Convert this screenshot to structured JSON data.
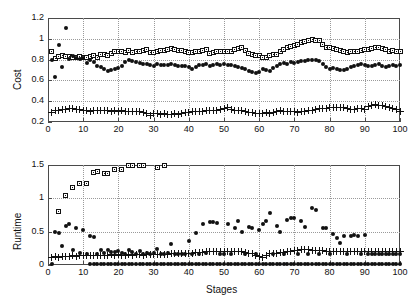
{
  "figure": {
    "background": "#ffffff",
    "axis_color": "#4a4a4a",
    "grid_color": "#9a9a9a",
    "marker_color": "#111111"
  },
  "chart_data": [
    {
      "type": "scatter",
      "id": "cost-panel",
      "title": "",
      "xlabel": "",
      "ylabel": "Cost",
      "xlim": [
        0,
        100
      ],
      "ylim": [
        0.2,
        1.2
      ],
      "xticks": [
        0,
        10,
        20,
        30,
        40,
        50,
        60,
        70,
        80,
        90,
        100
      ],
      "yticks": [
        0.2,
        0.4,
        0.6,
        0.8,
        1.0,
        1.2
      ],
      "xticklabels": [
        "0",
        "10",
        "20",
        "30",
        "40",
        "50",
        "60",
        "70",
        "80",
        "90",
        "100"
      ],
      "yticklabels": [
        "0.2",
        "0.4",
        "0.6",
        "0.8",
        "1",
        "1.2"
      ],
      "grid": true,
      "legend": "none",
      "x": [
        1,
        2,
        3,
        4,
        5,
        6,
        7,
        8,
        9,
        10,
        11,
        12,
        13,
        14,
        15,
        16,
        17,
        18,
        19,
        20,
        21,
        22,
        23,
        24,
        25,
        26,
        27,
        28,
        29,
        30,
        31,
        32,
        33,
        34,
        35,
        36,
        37,
        38,
        39,
        40,
        41,
        42,
        43,
        44,
        45,
        46,
        47,
        48,
        49,
        50,
        51,
        52,
        53,
        54,
        55,
        56,
        57,
        58,
        59,
        60,
        61,
        62,
        63,
        64,
        65,
        66,
        67,
        68,
        69,
        70,
        71,
        72,
        73,
        74,
        75,
        76,
        77,
        78,
        79,
        80,
        81,
        82,
        83,
        84,
        85,
        86,
        87,
        88,
        89,
        90,
        91,
        92,
        93,
        94,
        95,
        96,
        97,
        98,
        99,
        100
      ],
      "series": [
        {
          "name": "marker-square",
          "marker": "square",
          "values": [
            0.88,
            0.81,
            0.83,
            0.84,
            0.83,
            0.83,
            0.82,
            0.82,
            0.83,
            0.82,
            0.82,
            0.83,
            0.84,
            0.82,
            0.85,
            0.85,
            0.84,
            0.86,
            0.88,
            0.88,
            0.88,
            0.87,
            0.89,
            0.87,
            0.88,
            0.88,
            0.89,
            0.9,
            0.87,
            0.87,
            0.88,
            0.89,
            0.89,
            0.9,
            0.91,
            0.9,
            0.89,
            0.89,
            0.88,
            0.87,
            0.87,
            0.88,
            0.88,
            0.89,
            0.9,
            0.86,
            0.87,
            0.88,
            0.88,
            0.88,
            0.88,
            0.88,
            0.9,
            0.91,
            0.92,
            0.89,
            0.86,
            0.85,
            0.84,
            0.84,
            0.82,
            0.82,
            0.84,
            0.85,
            0.85,
            0.88,
            0.9,
            0.92,
            0.93,
            0.94,
            0.95,
            0.96,
            0.97,
            0.98,
            0.99,
            0.98,
            0.98,
            0.95,
            0.92,
            0.92,
            0.91,
            0.9,
            0.89,
            0.88,
            0.87,
            0.88,
            0.88,
            0.88,
            0.89,
            0.9,
            0.9,
            0.91,
            0.92,
            0.92,
            0.91,
            0.9,
            0.88,
            0.89,
            0.88,
            0.88
          ]
        },
        {
          "name": "marker-dot",
          "marker": "dot",
          "values": [
            0.8,
            0.63,
            0.94,
            0.73,
            1.1,
            0.81,
            0.83,
            0.82,
            0.81,
            0.82,
            0.77,
            0.8,
            0.78,
            0.74,
            0.73,
            0.71,
            0.69,
            0.7,
            0.71,
            0.72,
            0.74,
            0.78,
            0.8,
            0.79,
            0.78,
            0.77,
            0.76,
            0.76,
            0.75,
            0.74,
            0.76,
            0.75,
            0.75,
            0.75,
            0.76,
            0.75,
            0.74,
            0.74,
            0.74,
            0.73,
            0.71,
            0.73,
            0.75,
            0.75,
            0.76,
            0.74,
            0.75,
            0.76,
            0.75,
            0.76,
            0.75,
            0.75,
            0.74,
            0.73,
            0.72,
            0.71,
            0.69,
            0.68,
            0.67,
            0.68,
            0.71,
            0.7,
            0.69,
            0.72,
            0.74,
            0.76,
            0.77,
            0.76,
            0.78,
            0.77,
            0.78,
            0.79,
            0.79,
            0.8,
            0.8,
            0.8,
            0.79,
            0.76,
            0.73,
            0.71,
            0.72,
            0.71,
            0.7,
            0.7,
            0.71,
            0.73,
            0.74,
            0.75,
            0.76,
            0.75,
            0.74,
            0.74,
            0.75,
            0.76,
            0.74,
            0.73,
            0.74,
            0.75,
            0.74,
            0.75
          ]
        },
        {
          "name": "marker-plus",
          "marker": "plus",
          "values": [
            0.29,
            0.31,
            0.31,
            0.32,
            0.32,
            0.33,
            0.33,
            0.32,
            0.32,
            0.31,
            0.31,
            0.3,
            0.31,
            0.31,
            0.31,
            0.31,
            0.31,
            0.3,
            0.31,
            0.3,
            0.31,
            0.3,
            0.3,
            0.3,
            0.3,
            0.3,
            0.29,
            0.28,
            0.26,
            0.28,
            0.28,
            0.27,
            0.28,
            0.27,
            0.27,
            0.28,
            0.27,
            0.28,
            0.29,
            0.29,
            0.3,
            0.3,
            0.3,
            0.3,
            0.31,
            0.31,
            0.31,
            0.31,
            0.32,
            0.33,
            0.34,
            0.32,
            0.31,
            0.31,
            0.31,
            0.3,
            0.29,
            0.29,
            0.28,
            0.28,
            0.28,
            0.29,
            0.28,
            0.29,
            0.3,
            0.31,
            0.3,
            0.3,
            0.3,
            0.3,
            0.29,
            0.3,
            0.3,
            0.31,
            0.31,
            0.32,
            0.33,
            0.33,
            0.33,
            0.34,
            0.34,
            0.34,
            0.34,
            0.34,
            0.33,
            0.32,
            0.32,
            0.33,
            0.33,
            0.32,
            0.35,
            0.36,
            0.37,
            0.36,
            0.36,
            0.35,
            0.34,
            0.33,
            0.32,
            0.3
          ]
        }
      ]
    },
    {
      "type": "scatter",
      "id": "runtime-panel",
      "title": "",
      "xlabel": "Stages",
      "ylabel": "Runtime",
      "xlim": [
        0,
        100
      ],
      "ylim": [
        0,
        1.5
      ],
      "xticks": [
        0,
        10,
        20,
        30,
        40,
        50,
        60,
        70,
        80,
        90,
        100
      ],
      "yticks": [
        0,
        0.5,
        1.0,
        1.5
      ],
      "xticklabels": [
        "0",
        "10",
        "20",
        "30",
        "40",
        "50",
        "60",
        "70",
        "80",
        "90",
        "100"
      ],
      "yticklabels": [
        "0",
        "0.5",
        "1",
        "1.5"
      ],
      "grid": true,
      "legend": "none",
      "x": [
        1,
        2,
        3,
        4,
        5,
        6,
        7,
        8,
        9,
        10,
        11,
        12,
        13,
        14,
        15,
        16,
        17,
        18,
        19,
        20,
        21,
        22,
        23,
        24,
        25,
        26,
        27,
        28,
        29,
        30,
        31,
        32,
        33,
        34,
        35,
        36,
        37,
        38,
        39,
        40,
        41,
        42,
        43,
        44,
        45,
        46,
        47,
        48,
        49,
        50,
        51,
        52,
        53,
        54,
        55,
        56,
        57,
        58,
        59,
        60,
        61,
        62,
        63,
        64,
        65,
        66,
        67,
        68,
        69,
        70,
        71,
        72,
        73,
        74,
        75,
        76,
        77,
        78,
        79,
        80,
        81,
        82,
        83,
        84,
        85,
        86,
        87,
        88,
        89,
        90,
        91,
        92,
        93,
        94,
        95,
        96,
        97,
        98,
        99,
        100
      ],
      "series": [
        {
          "name": "marker-square",
          "marker": "square",
          "note": "series stops after stage 33; clipped at ylim max 1.5",
          "values": [
            null,
            null,
            0.81,
            null,
            1.05,
            null,
            1.17,
            null,
            1.23,
            null,
            1.23,
            null,
            1.39,
            1.4,
            null,
            1.38,
            1.38,
            null,
            1.43,
            null,
            1.44,
            null,
            1.5,
            1.5,
            null,
            1.5,
            1.5,
            null,
            null,
            null,
            1.47,
            null,
            1.5,
            null,
            null,
            null,
            null,
            null,
            null,
            null,
            null,
            null,
            null,
            null,
            null,
            null,
            null,
            null,
            null,
            null,
            null,
            null,
            null,
            null,
            null,
            null,
            null,
            null,
            null,
            null,
            null,
            null,
            null,
            null,
            null,
            null,
            null,
            null,
            null,
            null,
            null,
            null,
            null,
            null,
            null,
            null,
            null,
            null,
            null,
            null,
            null,
            null,
            null,
            null,
            null,
            null,
            null,
            null,
            null,
            null,
            null,
            null,
            null,
            null,
            null,
            null,
            null,
            null,
            null,
            null
          ]
        },
        {
          "name": "marker-dot-upper",
          "marker": "dot",
          "values": [
            0.01,
            0.5,
            0.48,
            0.29,
            0.58,
            0.61,
            0.22,
            0.55,
            0.18,
            0.53,
            0.16,
            0.44,
            0.42,
            0.17,
            0.22,
            0.18,
            0.23,
            0.2,
            0.19,
            0.21,
            0.18,
            0.17,
            0.23,
            0.19,
            0.17,
            0.21,
            0.17,
            0.18,
            0.16,
            0.18,
            0.24,
            0.16,
            0.17,
            0.18,
            0.31,
            0.17,
            0.17,
            0.17,
            0.16,
            0.36,
            0.17,
            0.48,
            0.17,
            0.62,
            0.18,
            0.65,
            0.65,
            0.63,
            0.17,
            0.17,
            0.62,
            0.16,
            0.55,
            0.66,
            0.49,
            0.16,
            0.57,
            0.55,
            0.16,
            0.52,
            0.61,
            0.66,
            0.78,
            0.16,
            0.58,
            0.5,
            0.16,
            0.68,
            0.7,
            0.71,
            0.16,
            0.66,
            0.57,
            0.16,
            0.85,
            0.82,
            0.17,
            0.56,
            0.56,
            0.17,
            0.47,
            0.41,
            0.33,
            0.44,
            0.16,
            0.44,
            0.45,
            0.44,
            0.16,
            0.45,
            0.16,
            0.16,
            0.16,
            0.16,
            0.16,
            0.16,
            0.16,
            0.16,
            0.16,
            0.16
          ]
        },
        {
          "name": "marker-plus",
          "marker": "plus",
          "values": [
            0.12,
            0.13,
            0.12,
            0.13,
            0.13,
            0.13,
            0.14,
            0.13,
            0.14,
            0.14,
            0.14,
            0.14,
            0.15,
            0.15,
            0.15,
            0.14,
            0.15,
            0.16,
            0.15,
            0.16,
            0.15,
            0.15,
            0.16,
            0.15,
            0.16,
            0.16,
            0.15,
            0.16,
            0.16,
            0.16,
            0.16,
            0.16,
            0.16,
            0.16,
            0.17,
            0.17,
            0.17,
            0.17,
            0.18,
            0.18,
            0.18,
            0.19,
            0.19,
            0.19,
            0.2,
            0.2,
            0.2,
            0.2,
            0.2,
            0.2,
            0.2,
            0.2,
            0.2,
            0.2,
            0.2,
            0.19,
            0.18,
            0.17,
            0.14,
            0.13,
            0.12,
            0.15,
            0.17,
            0.18,
            0.18,
            0.19,
            0.19,
            0.2,
            0.21,
            0.22,
            0.22,
            0.23,
            0.23,
            0.23,
            0.22,
            0.22,
            0.22,
            0.22,
            0.21,
            0.21,
            0.21,
            0.21,
            0.21,
            0.21,
            0.21,
            0.2,
            0.2,
            0.2,
            0.2,
            0.2,
            0.2,
            0.21,
            0.21,
            0.21,
            0.21,
            0.21,
            0.21,
            0.21,
            0.21,
            0.21
          ]
        },
        {
          "name": "marker-dot-baseline",
          "marker": "dot",
          "note": "near-zero baseline series, starts around stage 12",
          "values": [
            null,
            null,
            null,
            null,
            null,
            null,
            null,
            null,
            null,
            null,
            null,
            0.02,
            0.02,
            0.02,
            0.02,
            0.02,
            0.02,
            0.02,
            0.02,
            0.02,
            0.02,
            0.02,
            0.02,
            0.02,
            0.02,
            0.02,
            0.02,
            0.02,
            0.02,
            0.02,
            0.02,
            0.02,
            0.02,
            0.02,
            0.02,
            0.02,
            0.02,
            0.02,
            0.02,
            0.02,
            0.02,
            0.02,
            0.02,
            0.02,
            0.02,
            0.02,
            0.02,
            0.02,
            0.02,
            0.02,
            0.02,
            0.02,
            0.02,
            0.02,
            0.02,
            0.02,
            0.02,
            0.02,
            0.02,
            0.02,
            0.02,
            0.02,
            0.02,
            0.02,
            0.02,
            0.02,
            0.02,
            0.02,
            0.02,
            0.02,
            0.02,
            0.02,
            0.02,
            0.02,
            0.02,
            0.02,
            0.02,
            0.02,
            0.02,
            0.02,
            0.02,
            0.02,
            0.02,
            0.02,
            0.02,
            0.02,
            0.02,
            0.02,
            0.02,
            0.02,
            0.02,
            0.02,
            0.02,
            0.02,
            0.02,
            0.02,
            0.02,
            0.02,
            0.02,
            0.02
          ]
        }
      ]
    }
  ]
}
